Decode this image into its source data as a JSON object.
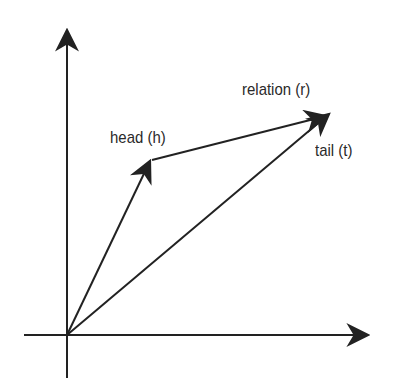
{
  "diagram": {
    "type": "vector-embedding-translation",
    "stroke_color": "#222222",
    "background": "#ffffff",
    "origin": {
      "x": 67,
      "y": 335
    },
    "axes": {
      "x_axis": {
        "from": [
          24,
          335
        ],
        "to": [
          370,
          335
        ]
      },
      "y_axis": {
        "from": [
          67,
          378
        ],
        "to": [
          67,
          28
        ]
      }
    },
    "vectors": [
      {
        "id": "h",
        "from": [
          67,
          335
        ],
        "to": [
          150,
          161
        ]
      },
      {
        "id": "r",
        "from": [
          152,
          160
        ],
        "to": [
          326,
          116
        ]
      },
      {
        "id": "t",
        "from": [
          67,
          335
        ],
        "to": [
          329,
          114
        ]
      }
    ],
    "labels": {
      "head": "head (h)",
      "relation": "relation (r)",
      "tail": "tail (t)"
    }
  }
}
